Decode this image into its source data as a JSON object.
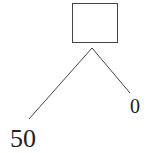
{
  "diagram": {
    "type": "game-tree",
    "root_node": {
      "shape": "rectangle",
      "label": ""
    },
    "branches": [
      {
        "direction": "left",
        "payoff": "50"
      },
      {
        "direction": "right",
        "payoff": "0"
      }
    ],
    "colors": {
      "line": "#333333",
      "text": "#222222",
      "background": "#ffffff"
    }
  }
}
